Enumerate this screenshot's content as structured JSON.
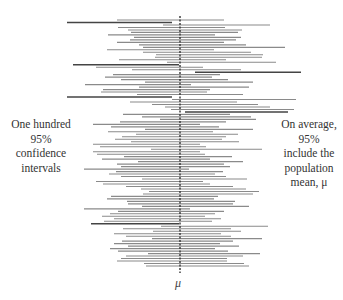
{
  "chart_data": {
    "type": "interval",
    "title": "",
    "xlabel": "μ",
    "ylabel": "",
    "mean_line": {
      "x_px": 180,
      "style": "dashed",
      "label": "μ"
    },
    "annotations": {
      "left": [
        "One hundred",
        "95%",
        "confidence",
        "intervals"
      ],
      "right": [
        "On average,",
        "95%",
        "include the",
        "population",
        "mean, μ"
      ]
    },
    "n_intervals": 100,
    "colors": {
      "hit": "#8a8a8a",
      "miss": "#444444",
      "mean_line": "#333333"
    },
    "intervals": [
      [
        117,
        224
      ],
      [
        67,
        172
      ],
      [
        163,
        270
      ],
      [
        118,
        225
      ],
      [
        128,
        242
      ],
      [
        131,
        238
      ],
      [
        108,
        215
      ],
      [
        134,
        241
      ],
      [
        130,
        236
      ],
      [
        117,
        224
      ],
      [
        139,
        246
      ],
      [
        143,
        285
      ],
      [
        107,
        214
      ],
      [
        143,
        251
      ],
      [
        156,
        263
      ],
      [
        155,
        262
      ],
      [
        119,
        226
      ],
      [
        167,
        276
      ],
      [
        73,
        179
      ],
      [
        96,
        203
      ],
      [
        132,
        241
      ],
      [
        195,
        301
      ],
      [
        113,
        220
      ],
      [
        105,
        212
      ],
      [
        121,
        228
      ],
      [
        145,
        253
      ],
      [
        85,
        191
      ],
      [
        139,
        249
      ],
      [
        103,
        210
      ],
      [
        101,
        207
      ],
      [
        137,
        243
      ],
      [
        67,
        172
      ],
      [
        172,
        296
      ],
      [
        130,
        237
      ],
      [
        152,
        258
      ],
      [
        165,
        270
      ],
      [
        171,
        294
      ],
      [
        185,
        288
      ],
      [
        123,
        230
      ],
      [
        142,
        251
      ],
      [
        160,
        256
      ],
      [
        120,
        226
      ],
      [
        93,
        200
      ],
      [
        111,
        219
      ],
      [
        145,
        253
      ],
      [
        108,
        213
      ],
      [
        136,
        238
      ],
      [
        122,
        226
      ],
      [
        115,
        222
      ],
      [
        131,
        239
      ],
      [
        93,
        200
      ],
      [
        100,
        206
      ],
      [
        151,
        262
      ],
      [
        93,
        200
      ],
      [
        97,
        205
      ],
      [
        124,
        232
      ],
      [
        102,
        210
      ],
      [
        138,
        243
      ],
      [
        117,
        224
      ],
      [
        121,
        230
      ],
      [
        84,
        189
      ],
      [
        116,
        223
      ],
      [
        109,
        215
      ],
      [
        121,
        226
      ],
      [
        142,
        247
      ],
      [
        96,
        203
      ],
      [
        103,
        210
      ],
      [
        126,
        233
      ],
      [
        141,
        246
      ],
      [
        149,
        259
      ],
      [
        143,
        253
      ],
      [
        111,
        218
      ],
      [
        107,
        214
      ],
      [
        127,
        235
      ],
      [
        128,
        233
      ],
      [
        142,
        249
      ],
      [
        84,
        190
      ],
      [
        118,
        224
      ],
      [
        110,
        215
      ],
      [
        102,
        205
      ],
      [
        114,
        221
      ],
      [
        104,
        212
      ],
      [
        91,
        179
      ],
      [
        161,
        268
      ],
      [
        123,
        231
      ],
      [
        153,
        241
      ],
      [
        114,
        221
      ],
      [
        126,
        231
      ],
      [
        152,
        262
      ],
      [
        122,
        233
      ],
      [
        114,
        220
      ],
      [
        128,
        239
      ],
      [
        110,
        215
      ],
      [
        118,
        228
      ],
      [
        148,
        260
      ],
      [
        126,
        243
      ],
      [
        121,
        227
      ],
      [
        117,
        227
      ],
      [
        144,
        244
      ],
      [
        146,
        249
      ],
      [
        141,
        247
      ],
      [
        138,
        245
      ],
      [
        145,
        251
      ],
      [
        140,
        248
      ],
      [
        143,
        249
      ]
    ],
    "misses_index": [
      1,
      18,
      21,
      31,
      32,
      37,
      82
    ]
  }
}
